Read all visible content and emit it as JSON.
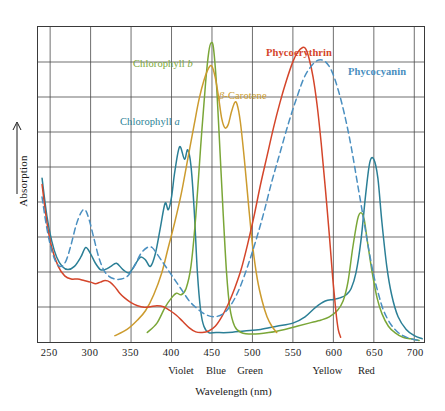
{
  "chart_data": {
    "type": "line",
    "title": "",
    "xlabel": "Wavelength (nm)",
    "ylabel": "Absorption",
    "xlim": [
      235,
      712
    ],
    "ylim": [
      0,
      1
    ],
    "grid": true,
    "legend_position": "inline-annotations",
    "xticks": [
      250,
      300,
      350,
      400,
      450,
      500,
      550,
      600,
      650,
      700
    ],
    "xtick_labels": [
      "250",
      "300",
      "350",
      "400",
      "450",
      "500",
      "550",
      "600",
      "650",
      "700"
    ],
    "yticks_count": 9,
    "ytick_labels": [],
    "color_band_labels": [
      {
        "label": "Violet",
        "x": 412
      },
      {
        "label": "Blue",
        "x": 455
      },
      {
        "label": "Green",
        "x": 497
      },
      {
        "label": "Yellow",
        "x": 592
      },
      {
        "label": "Red",
        "x": 640
      }
    ],
    "series": [
      {
        "name": "Chlorophyll a",
        "color": "#2b7f96",
        "style": "solid",
        "label_x": 120,
        "label_y": 116,
        "points": [
          [
            240,
            0.52
          ],
          [
            246,
            0.4
          ],
          [
            252,
            0.32
          ],
          [
            258,
            0.27
          ],
          [
            265,
            0.24
          ],
          [
            272,
            0.23
          ],
          [
            280,
            0.24
          ],
          [
            288,
            0.27
          ],
          [
            294,
            0.3
          ],
          [
            300,
            0.28
          ],
          [
            306,
            0.25
          ],
          [
            312,
            0.23
          ],
          [
            318,
            0.23
          ],
          [
            325,
            0.24
          ],
          [
            332,
            0.25
          ],
          [
            340,
            0.23
          ],
          [
            348,
            0.22
          ],
          [
            356,
            0.25
          ],
          [
            362,
            0.27
          ],
          [
            368,
            0.26
          ],
          [
            374,
            0.24
          ],
          [
            380,
            0.28
          ],
          [
            386,
            0.36
          ],
          [
            392,
            0.44
          ],
          [
            396,
            0.42
          ],
          [
            400,
            0.46
          ],
          [
            404,
            0.54
          ],
          [
            410,
            0.62
          ],
          [
            416,
            0.58
          ],
          [
            420,
            0.61
          ],
          [
            424,
            0.56
          ],
          [
            428,
            0.42
          ],
          [
            432,
            0.22
          ],
          [
            436,
            0.1
          ],
          [
            440,
            0.05
          ],
          [
            446,
            0.03
          ],
          [
            455,
            0.03
          ],
          [
            470,
            0.03
          ],
          [
            490,
            0.035
          ],
          [
            510,
            0.04
          ],
          [
            530,
            0.05
          ],
          [
            550,
            0.06
          ],
          [
            565,
            0.08
          ],
          [
            578,
            0.11
          ],
          [
            590,
            0.13
          ],
          [
            600,
            0.135
          ],
          [
            608,
            0.14
          ],
          [
            616,
            0.15
          ],
          [
            622,
            0.17
          ],
          [
            628,
            0.22
          ],
          [
            634,
            0.32
          ],
          [
            640,
            0.47
          ],
          [
            645,
            0.57
          ],
          [
            650,
            0.58
          ],
          [
            655,
            0.52
          ],
          [
            660,
            0.38
          ],
          [
            666,
            0.24
          ],
          [
            672,
            0.15
          ],
          [
            680,
            0.08
          ],
          [
            690,
            0.04
          ],
          [
            700,
            0.02
          ],
          [
            710,
            0.01
          ]
        ]
      },
      {
        "name": "Chlorophyll b",
        "color": "#7aa637",
        "style": "solid",
        "label_x": 133,
        "label_y": 58,
        "points": [
          [
            370,
            0.03
          ],
          [
            382,
            0.06
          ],
          [
            392,
            0.11
          ],
          [
            400,
            0.14
          ],
          [
            406,
            0.155
          ],
          [
            412,
            0.15
          ],
          [
            418,
            0.17
          ],
          [
            424,
            0.24
          ],
          [
            430,
            0.4
          ],
          [
            436,
            0.62
          ],
          [
            442,
            0.82
          ],
          [
            446,
            0.92
          ],
          [
            449,
            0.95
          ],
          [
            452,
            0.93
          ],
          [
            456,
            0.8
          ],
          [
            460,
            0.6
          ],
          [
            464,
            0.4
          ],
          [
            468,
            0.22
          ],
          [
            472,
            0.11
          ],
          [
            478,
            0.05
          ],
          [
            486,
            0.03
          ],
          [
            500,
            0.025
          ],
          [
            520,
            0.03
          ],
          [
            540,
            0.04
          ],
          [
            555,
            0.05
          ],
          [
            570,
            0.06
          ],
          [
            585,
            0.07
          ],
          [
            595,
            0.08
          ],
          [
            605,
            0.1
          ],
          [
            612,
            0.13
          ],
          [
            618,
            0.19
          ],
          [
            624,
            0.3
          ],
          [
            630,
            0.39
          ],
          [
            634,
            0.41
          ],
          [
            638,
            0.39
          ],
          [
            642,
            0.32
          ],
          [
            648,
            0.22
          ],
          [
            654,
            0.14
          ],
          [
            660,
            0.09
          ],
          [
            668,
            0.05
          ],
          [
            676,
            0.03
          ],
          [
            686,
            0.015
          ],
          [
            696,
            0.01
          ],
          [
            706,
            0.005
          ]
        ]
      },
      {
        "name": "β-Carotene",
        "color": "#cc9b2e",
        "style": "solid",
        "label_x": 219,
        "label_y": 90,
        "points": [
          [
            330,
            0.02
          ],
          [
            345,
            0.04
          ],
          [
            358,
            0.07
          ],
          [
            368,
            0.1
          ],
          [
            378,
            0.15
          ],
          [
            388,
            0.22
          ],
          [
            396,
            0.3
          ],
          [
            404,
            0.38
          ],
          [
            412,
            0.47
          ],
          [
            420,
            0.58
          ],
          [
            428,
            0.69
          ],
          [
            434,
            0.77
          ],
          [
            440,
            0.83
          ],
          [
            446,
            0.87
          ],
          [
            450,
            0.875
          ],
          [
            454,
            0.84
          ],
          [
            458,
            0.78
          ],
          [
            462,
            0.71
          ],
          [
            466,
            0.68
          ],
          [
            470,
            0.69
          ],
          [
            474,
            0.73
          ],
          [
            478,
            0.76
          ],
          [
            481,
            0.755
          ],
          [
            485,
            0.7
          ],
          [
            490,
            0.58
          ],
          [
            495,
            0.44
          ],
          [
            500,
            0.31
          ],
          [
            506,
            0.2
          ],
          [
            512,
            0.13
          ],
          [
            518,
            0.08
          ],
          [
            524,
            0.05
          ],
          [
            530,
            0.03
          ]
        ]
      },
      {
        "name": "Phycoerythrin",
        "color": "#d4452a",
        "style": "solid",
        "label_x": 266,
        "label_y": 47,
        "points": [
          [
            240,
            0.5
          ],
          [
            246,
            0.38
          ],
          [
            252,
            0.3
          ],
          [
            260,
            0.24
          ],
          [
            268,
            0.21
          ],
          [
            276,
            0.2
          ],
          [
            284,
            0.2
          ],
          [
            292,
            0.195
          ],
          [
            300,
            0.19
          ],
          [
            306,
            0.185
          ],
          [
            312,
            0.19
          ],
          [
            318,
            0.195
          ],
          [
            324,
            0.19
          ],
          [
            330,
            0.175
          ],
          [
            336,
            0.155
          ],
          [
            342,
            0.14
          ],
          [
            350,
            0.125
          ],
          [
            358,
            0.115
          ],
          [
            366,
            0.11
          ],
          [
            374,
            0.112
          ],
          [
            382,
            0.115
          ],
          [
            390,
            0.112
          ],
          [
            398,
            0.1
          ],
          [
            406,
            0.085
          ],
          [
            414,
            0.065
          ],
          [
            422,
            0.045
          ],
          [
            430,
            0.032
          ],
          [
            438,
            0.03
          ],
          [
            446,
            0.035
          ],
          [
            454,
            0.05
          ],
          [
            462,
            0.08
          ],
          [
            470,
            0.12
          ],
          [
            478,
            0.17
          ],
          [
            486,
            0.23
          ],
          [
            494,
            0.31
          ],
          [
            502,
            0.4
          ],
          [
            510,
            0.5
          ],
          [
            518,
            0.59
          ],
          [
            526,
            0.68
          ],
          [
            534,
            0.76
          ],
          [
            542,
            0.83
          ],
          [
            550,
            0.89
          ],
          [
            556,
            0.92
          ],
          [
            562,
            0.935
          ],
          [
            566,
            0.93
          ],
          [
            570,
            0.9
          ],
          [
            575,
            0.84
          ],
          [
            580,
            0.75
          ],
          [
            585,
            0.63
          ],
          [
            590,
            0.49
          ],
          [
            595,
            0.34
          ],
          [
            599,
            0.21
          ],
          [
            603,
            0.1
          ],
          [
            606,
            0.04
          ],
          [
            609,
            0.015
          ]
        ]
      },
      {
        "name": "Phycocyanin",
        "color": "#4a8fc0",
        "style": "dashed",
        "label_x": 348,
        "label_y": 66,
        "points": [
          [
            240,
            0.46
          ],
          [
            246,
            0.36
          ],
          [
            252,
            0.29
          ],
          [
            258,
            0.25
          ],
          [
            264,
            0.24
          ],
          [
            270,
            0.26
          ],
          [
            276,
            0.31
          ],
          [
            282,
            0.37
          ],
          [
            288,
            0.41
          ],
          [
            293,
            0.42
          ],
          [
            298,
            0.39
          ],
          [
            304,
            0.33
          ],
          [
            310,
            0.27
          ],
          [
            316,
            0.23
          ],
          [
            322,
            0.21
          ],
          [
            330,
            0.2
          ],
          [
            338,
            0.2
          ],
          [
            346,
            0.21
          ],
          [
            354,
            0.24
          ],
          [
            362,
            0.28
          ],
          [
            370,
            0.3
          ],
          [
            376,
            0.3
          ],
          [
            382,
            0.28
          ],
          [
            390,
            0.25
          ],
          [
            398,
            0.22
          ],
          [
            406,
            0.19
          ],
          [
            414,
            0.16
          ],
          [
            422,
            0.13
          ],
          [
            430,
            0.11
          ],
          [
            440,
            0.09
          ],
          [
            452,
            0.08
          ],
          [
            464,
            0.09
          ],
          [
            474,
            0.12
          ],
          [
            484,
            0.17
          ],
          [
            494,
            0.24
          ],
          [
            504,
            0.32
          ],
          [
            514,
            0.41
          ],
          [
            524,
            0.51
          ],
          [
            534,
            0.6
          ],
          [
            544,
            0.69
          ],
          [
            554,
            0.77
          ],
          [
            564,
            0.84
          ],
          [
            574,
            0.88
          ],
          [
            582,
            0.895
          ],
          [
            590,
            0.89
          ],
          [
            598,
            0.86
          ],
          [
            606,
            0.8
          ],
          [
            614,
            0.72
          ],
          [
            622,
            0.62
          ],
          [
            630,
            0.5
          ],
          [
            638,
            0.38
          ],
          [
            644,
            0.29
          ],
          [
            650,
            0.21
          ],
          [
            656,
            0.15
          ],
          [
            662,
            0.1
          ],
          [
            670,
            0.06
          ],
          [
            678,
            0.035
          ],
          [
            686,
            0.02
          ],
          [
            696,
            0.01
          ],
          [
            706,
            0.005
          ]
        ]
      }
    ]
  },
  "axis": {
    "y_title": "Absorption",
    "x_title": "Wavelength (nm)"
  },
  "labels": {
    "chlorophyll_a_prefix": "Chlorophyll ",
    "chlorophyll_a_ital": "a",
    "chlorophyll_b_prefix": "Chlorophyll ",
    "chlorophyll_b_ital": "b",
    "beta_carotene_ital": "β",
    "beta_carotene_rest": "-Carotene",
    "phycoerythrin": "Phycoerythrin",
    "phycocyanin": "Phycocyanin"
  }
}
